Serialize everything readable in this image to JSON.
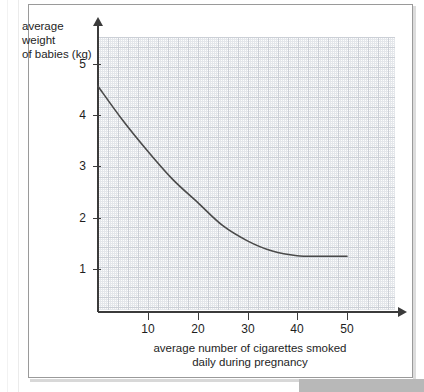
{
  "chart_data": {
    "type": "line",
    "title": "",
    "xlabel": "average number of cigarettes smoked daily during pregnancy",
    "ylabel": "average weight of babies (kg)",
    "xlabel_line1": "average number of cigarettes smoked",
    "xlabel_line2": "daily during pregnancy",
    "ylabel_line1": "average weight",
    "ylabel_line2": "of babies (kg)",
    "grid": true,
    "grid_style": "graph-paper",
    "legend": "none",
    "xlim": [
      0,
      60
    ],
    "ylim": [
      0,
      5.6
    ],
    "x_ticks": [
      10,
      20,
      30,
      40,
      50
    ],
    "x_tick_labels": [
      "10",
      "20",
      "30",
      "40",
      "50"
    ],
    "y_ticks": [
      1,
      2,
      3,
      4,
      5
    ],
    "y_tick_labels": [
      "1",
      "2",
      "3",
      "4",
      "5"
    ],
    "series": [
      {
        "name": "average weight of babies",
        "color": "#4a4a4a",
        "x": [
          0,
          5,
          10,
          15,
          20,
          25,
          30,
          35,
          40,
          45,
          50
        ],
        "y": [
          4.57,
          3.9,
          3.3,
          2.75,
          2.3,
          1.85,
          1.55,
          1.35,
          1.26,
          1.25,
          1.25
        ]
      }
    ],
    "annotations": []
  },
  "axes": {
    "y_axis_name": "y-axis",
    "x_axis_name": "x-axis"
  }
}
